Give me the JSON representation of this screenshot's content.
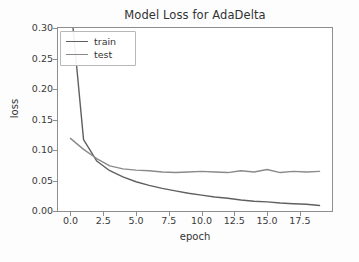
{
  "chart_data": {
    "type": "line",
    "title": "Model Loss for AdaDelta",
    "xlabel": "epoch",
    "ylabel": "loss",
    "xlim": [
      -0.95,
      19.95
    ],
    "ylim": [
      0.0,
      0.3
    ],
    "grid": false,
    "legend_position": "upper left",
    "xticks": [
      "0.0",
      "2.5",
      "5.0",
      "7.5",
      "10.0",
      "12.5",
      "15.0",
      "17.5"
    ],
    "xtick_values": [
      0.0,
      2.5,
      5.0,
      7.5,
      10.0,
      12.5,
      15.0,
      17.5
    ],
    "yticks": [
      "0.00",
      "0.05",
      "0.10",
      "0.15",
      "0.20",
      "0.25",
      "0.30"
    ],
    "ytick_values": [
      0.0,
      0.05,
      0.1,
      0.15,
      0.2,
      0.25,
      0.3
    ],
    "x": [
      0,
      1,
      2,
      3,
      4,
      5,
      6,
      7,
      8,
      9,
      10,
      11,
      12,
      13,
      14,
      15,
      16,
      17,
      18,
      19
    ],
    "series": [
      {
        "name": "train",
        "color": "#606060",
        "values": [
          0.345,
          0.117,
          0.082,
          0.066,
          0.056,
          0.048,
          0.042,
          0.037,
          0.033,
          0.029,
          0.026,
          0.023,
          0.021,
          0.018,
          0.016,
          0.015,
          0.013,
          0.012,
          0.011,
          0.009
        ]
      },
      {
        "name": "test",
        "color": "#8a8a8a",
        "values": [
          0.119,
          0.101,
          0.086,
          0.074,
          0.069,
          0.067,
          0.066,
          0.064,
          0.063,
          0.064,
          0.065,
          0.064,
          0.063,
          0.066,
          0.064,
          0.068,
          0.063,
          0.065,
          0.064,
          0.065
        ]
      }
    ]
  },
  "legend": {
    "entries": [
      {
        "label": "train"
      },
      {
        "label": "test"
      }
    ]
  }
}
